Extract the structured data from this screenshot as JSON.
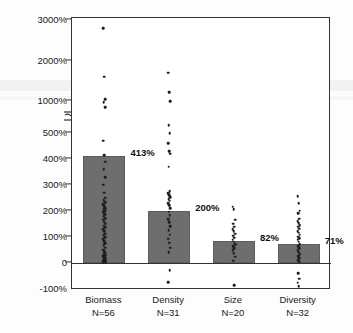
{
  "chart_data": {
    "type": "bar",
    "title": "",
    "subtitle": "",
    "xlabel": "",
    "ylabel": "Percent Increases in Key Biological Measures",
    "categories": [
      "Biomass",
      "Density",
      "Size",
      "Diversity"
    ],
    "category_sublabels": [
      "N=56",
      "N=31",
      "N=20",
      "N=32"
    ],
    "values": [
      413,
      200,
      82,
      71
    ],
    "value_labels": [
      "413%",
      "200%",
      "82%",
      "71%"
    ],
    "ylim": [
      -100,
      3000
    ],
    "axis_break": {
      "present": true,
      "between": [
        500,
        1000
      ],
      "label": "axis-break"
    },
    "ytick_labels": [
      "3000%",
      "2000%",
      "1000%",
      "500%",
      "400%",
      "300%",
      "200%",
      "100%",
      "0",
      "-100%"
    ],
    "ytick_values": [
      3000,
      2000,
      1000,
      500,
      400,
      300,
      200,
      100,
      0,
      -100
    ],
    "grid": false,
    "legend": "none",
    "bar_color": "#6e6e6e",
    "point_color": "#1e1e1e",
    "axis_color": "#333333",
    "overlay_points": {
      "Biomass": [
        2800,
        1600,
        1050,
        980,
        900,
        470,
        415,
        390,
        360,
        330,
        300,
        270,
        250,
        240,
        232,
        225,
        218,
        210,
        205,
        200,
        196,
        190,
        185,
        180,
        172,
        165,
        158,
        150,
        143,
        136,
        128,
        120,
        112,
        105,
        98,
        90,
        82,
        74,
        66,
        58,
        50,
        44,
        38,
        32,
        28,
        24,
        20,
        16,
        13,
        10,
        8,
        6,
        4,
        3,
        2,
        1
      ],
      "Density": [
        1700,
        1220,
        1000,
        620,
        500,
        460,
        430,
        420,
        370,
        275,
        268,
        260,
        252,
        245,
        238,
        230,
        222,
        210,
        196,
        182,
        168,
        155,
        140,
        125,
        108,
        92,
        76,
        58,
        40,
        -30,
        -75
      ],
      "Size": [
        215,
        205,
        165,
        150,
        138,
        128,
        120,
        112,
        104,
        96,
        88,
        80,
        72,
        64,
        56,
        48,
        36,
        22,
        8,
        -88
      ],
      "Diversity": [
        255,
        230,
        200,
        190,
        170,
        160,
        152,
        145,
        138,
        130,
        122,
        115,
        108,
        100,
        94,
        88,
        80,
        72,
        64,
        56,
        48,
        40,
        32,
        24,
        16,
        10,
        6,
        3,
        -40,
        -62,
        -78,
        -92
      ]
    }
  },
  "figure": {
    "ylabel_text": "Percent Increases in Key Biological Measures"
  }
}
